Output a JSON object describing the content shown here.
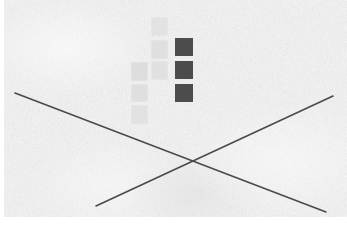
{
  "scene": {
    "title": "Textured canvas with staircase square grid and crossed lines",
    "width": 347,
    "height": 227,
    "background_color": "#e9e9e9",
    "margin_color": "#ffffff",
    "left_margin_px": 4,
    "bottom_margin_px": 10,
    "texture": "speckled-noise-paper"
  },
  "grid": {
    "label": "staircase-square-arrangement",
    "tile_size": 17,
    "column_count": 3,
    "colors": {
      "light": "#e0e0e0",
      "light_alt": "#e3e3e3",
      "dark": "#4c4c4c"
    },
    "tiles": [
      {
        "id": "tile-c2-r1",
        "column": 2,
        "row": 1,
        "x": 151,
        "y": 17,
        "w": 17,
        "h": 19,
        "shade": "light",
        "color": "#e2e2e2"
      },
      {
        "id": "tile-c2-r2",
        "column": 2,
        "row": 2,
        "x": 151,
        "y": 40,
        "w": 17,
        "h": 19,
        "shade": "light",
        "color": "#dedede"
      },
      {
        "id": "tile-c3-r2",
        "column": 3,
        "row": 2,
        "x": 175,
        "y": 38,
        "w": 18,
        "h": 18,
        "shade": "dark",
        "color": "#4c4c4c"
      },
      {
        "id": "tile-c1-r3",
        "column": 1,
        "row": 3,
        "x": 131,
        "y": 62,
        "w": 17,
        "h": 19,
        "shade": "light",
        "color": "#dcdcdc"
      },
      {
        "id": "tile-c2-r3",
        "column": 2,
        "row": 3,
        "x": 151,
        "y": 61,
        "w": 17,
        "h": 19,
        "shade": "light",
        "color": "#e0e0e0"
      },
      {
        "id": "tile-c3-r3",
        "column": 3,
        "row": 3,
        "x": 175,
        "y": 61,
        "w": 18,
        "h": 18,
        "shade": "dark",
        "color": "#4c4c4c"
      },
      {
        "id": "tile-c1-r4",
        "column": 1,
        "row": 4,
        "x": 131,
        "y": 84,
        "w": 17,
        "h": 18,
        "shade": "light",
        "color": "#dedede"
      },
      {
        "id": "tile-c3-r4",
        "column": 3,
        "row": 4,
        "x": 175,
        "y": 84,
        "w": 18,
        "h": 18,
        "shade": "dark",
        "color": "#4c4c4c"
      },
      {
        "id": "tile-c1-r5",
        "column": 1,
        "row": 5,
        "x": 131,
        "y": 105,
        "w": 17,
        "h": 19,
        "shade": "light",
        "color": "#e1e1e1"
      }
    ]
  },
  "lines": {
    "label": "crossed-diagonal-lines",
    "color": "#4a4a4a",
    "stroke_width": 1.6,
    "intersection": {
      "x": 190,
      "y": 158
    },
    "segments": [
      {
        "id": "line-descending",
        "description": "upper-left to lower-right",
        "x1": 15,
        "y1": 93,
        "x2": 326,
        "y2": 212
      },
      {
        "id": "line-ascending",
        "description": "lower-left to upper-right",
        "x1": 96,
        "y1": 206,
        "x2": 333,
        "y2": 96
      }
    ]
  }
}
